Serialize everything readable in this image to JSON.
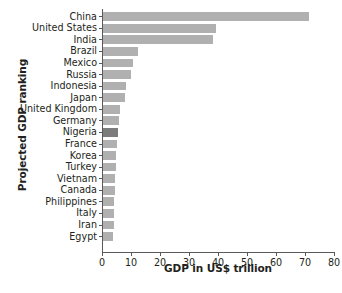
{
  "chart_data": {
    "type": "bar",
    "orientation": "horizontal",
    "title": "",
    "xlabel": "GDP in US$ trillion",
    "ylabel": "Projected GDP ranking",
    "xlim": [
      0,
      80
    ],
    "xticks": [
      0,
      10,
      20,
      30,
      40,
      50,
      60,
      70,
      80
    ],
    "grid": false,
    "legend": null,
    "bar_color": "#b0b0b0",
    "highlight_color": "#7c7c7c",
    "highlight_category": "Nigeria",
    "categories": [
      "China",
      "United States",
      "India",
      "Brazil",
      "Mexico",
      "Russia",
      "Indonesia",
      "Japan",
      "United Kingdom",
      "Germany",
      "Nigeria",
      "France",
      "Korea",
      "Turkey",
      "Vietnam",
      "Canada",
      "Philippines",
      "Italy",
      "Iran",
      "Egypt"
    ],
    "values": [
      71.0,
      39.0,
      38.0,
      12.0,
      10.5,
      9.5,
      8.0,
      7.5,
      6.0,
      5.5,
      5.0,
      4.8,
      4.6,
      4.4,
      4.2,
      4.0,
      3.9,
      3.8,
      3.7,
      3.5
    ]
  },
  "caption": {
    "partial_text": ""
  }
}
